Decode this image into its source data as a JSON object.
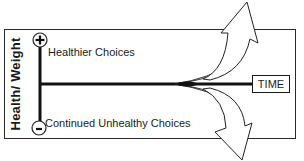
{
  "diagram": {
    "y_axis_label": "Health/ Weight",
    "x_axis_label": "TIME",
    "top_marker": "+",
    "bottom_marker": "-",
    "paths": [
      {
        "label": "Healthier Choices",
        "direction": "up"
      },
      {
        "label": "Continued Unhealthy Choices",
        "direction": "down"
      }
    ]
  },
  "colors": {
    "line": "#111111",
    "frame": "#2a2a2a",
    "background": "#ffffff"
  }
}
